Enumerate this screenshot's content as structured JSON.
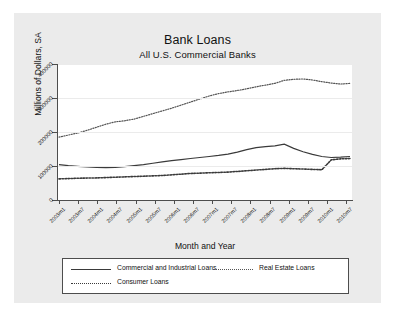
{
  "title": "Bank Loans",
  "subtitle": "All U.S. Commercial Banks",
  "chart_data": {
    "type": "line",
    "title": "Bank Loans",
    "subtitle": "All U.S. Commercial Banks",
    "xlabel": "Month and Year",
    "ylabel": "Millions of Dollars, SA",
    "ylim": [
      0,
      400000
    ],
    "yticks": [
      0,
      100000,
      200000,
      300000,
      400000
    ],
    "ytick_labels": [
      "0",
      "100000",
      "200000",
      "300000",
      "400000"
    ],
    "grid": true,
    "legend_position": "bottom",
    "xtick_labels": [
      "2003m1",
      "2003m7",
      "2004m1",
      "2004m7",
      "2005m1",
      "2005m7",
      "2006m1",
      "2006m7",
      "2007m1",
      "2007m7",
      "2008m1",
      "2008m7",
      "2009m1",
      "2009m7",
      "2010m1",
      "2010m7"
    ],
    "x": [
      "2003m1",
      "2003m4",
      "2003m7",
      "2003m10",
      "2004m1",
      "2004m4",
      "2004m7",
      "2004m10",
      "2005m1",
      "2005m4",
      "2005m7",
      "2005m10",
      "2006m1",
      "2006m4",
      "2006m7",
      "2006m10",
      "2007m1",
      "2007m4",
      "2007m7",
      "2007m10",
      "2008m1",
      "2008m4",
      "2008m7",
      "2008m10",
      "2009m1",
      "2009m4",
      "2009m7",
      "2009m10",
      "2010m1",
      "2010m4",
      "2010m7",
      "2010m10"
    ],
    "series": [
      {
        "name": "Commercial and Industrial Loans",
        "style": "solid",
        "color": "#3a3a3a",
        "values": [
          104000,
          101000,
          99000,
          97000,
          96000,
          95000,
          96000,
          98000,
          101000,
          104000,
          108000,
          112000,
          116000,
          119000,
          122000,
          125000,
          128000,
          131000,
          135000,
          141000,
          148000,
          154000,
          157000,
          159000,
          164000,
          152000,
          142000,
          134000,
          128000,
          125000,
          126000,
          128000
        ]
      },
      {
        "name": "Real Estate Loans",
        "style": "fine-dotted",
        "color": "#555555",
        "values": [
          185000,
          191000,
          197000,
          205000,
          214000,
          223000,
          230000,
          233000,
          238000,
          246000,
          254000,
          262000,
          270000,
          279000,
          288000,
          297000,
          306000,
          313000,
          318000,
          322000,
          327000,
          333000,
          338000,
          343000,
          352000,
          355000,
          356000,
          353000,
          348000,
          344000,
          341000,
          343000
        ]
      },
      {
        "name": "Consumer Loans",
        "style": "coarse-dotted",
        "color": "#3a3a3a",
        "values": [
          62000,
          63000,
          64000,
          64500,
          65000,
          66000,
          67000,
          68000,
          69000,
          70000,
          71000,
          72000,
          74000,
          76000,
          78000,
          79000,
          80000,
          81000,
          82000,
          84000,
          86000,
          88000,
          90000,
          92000,
          93000,
          92000,
          91000,
          90000,
          89000,
          118000,
          121000,
          122000
        ]
      }
    ]
  },
  "legend": {
    "items": [
      {
        "label": "Commercial and Industrial Loans",
        "style": "solid"
      },
      {
        "label": "Real Estate Loans",
        "style": "fine-dotted"
      },
      {
        "label": "Consumer Loans",
        "style": "coarse-dotted"
      }
    ]
  }
}
